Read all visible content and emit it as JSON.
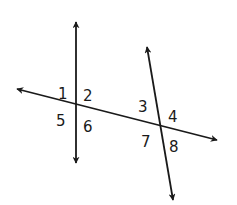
{
  "diagram": {
    "type": "geometry-lines-transversal",
    "colors": {
      "stroke": "#1a1a1a",
      "background": "#ffffff"
    },
    "lines": [
      {
        "id": "line-vertical-left",
        "from": [
          76,
          22
        ],
        "to": [
          76,
          163
        ]
      },
      {
        "id": "line-transversal",
        "from": [
          17,
          89
        ],
        "to": [
          217,
          140
        ]
      },
      {
        "id": "line-slanted-right",
        "from": [
          147,
          47
        ],
        "to": [
          173,
          200
        ]
      }
    ],
    "intersections": [
      {
        "id": "intersection-left",
        "point": [
          76,
          104
        ]
      },
      {
        "id": "intersection-right",
        "point": [
          160,
          125
        ]
      }
    ],
    "angle_labels": [
      {
        "id": "1",
        "text": "1",
        "x": 58,
        "y": 99
      },
      {
        "id": "2",
        "text": "2",
        "x": 83,
        "y": 101
      },
      {
        "id": "5",
        "text": "5",
        "x": 56,
        "y": 126
      },
      {
        "id": "6",
        "text": "6",
        "x": 83,
        "y": 132
      },
      {
        "id": "3",
        "text": "3",
        "x": 138,
        "y": 112
      },
      {
        "id": "4",
        "text": "4",
        "x": 168,
        "y": 122
      },
      {
        "id": "7",
        "text": "7",
        "x": 141,
        "y": 147
      },
      {
        "id": "8",
        "text": "8",
        "x": 169,
        "y": 152
      }
    ]
  }
}
